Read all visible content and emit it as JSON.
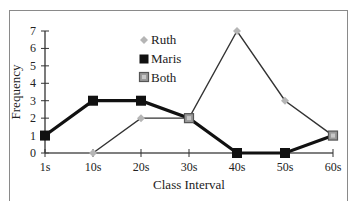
{
  "chart_data": {
    "type": "line",
    "title": "",
    "xlabel": "Class Interval",
    "ylabel": "Frequency",
    "categories": [
      "1s",
      "10s",
      "20s",
      "30s",
      "40s",
      "50s",
      "60s"
    ],
    "yticks": [
      "0",
      "1",
      "2",
      "3",
      "4",
      "5",
      "6",
      "7"
    ],
    "ylim": [
      0,
      7
    ],
    "grid": false,
    "legend_position": "upper-center-inside",
    "series": [
      {
        "name": "Ruth",
        "values": [
          null,
          0,
          2,
          2,
          7,
          3,
          1
        ],
        "color": "#b5b5b5",
        "line_color": "#333333",
        "marker": "diamond"
      },
      {
        "name": "Maris",
        "values": [
          1,
          3,
          3,
          2,
          0,
          0,
          1
        ],
        "color": "#111111",
        "line_color": "#111111",
        "marker": "square"
      }
    ],
    "legend": [
      {
        "label": "Ruth",
        "marker": "diamond",
        "color": "#b5b5b5"
      },
      {
        "label": "Maris",
        "marker": "square",
        "color": "#111111"
      },
      {
        "label": "Both",
        "marker": "square-outlined",
        "color": "#9a9a9a"
      }
    ],
    "annotations": [
      "'Both' marker shown where Ruth and Maris values coincide (30s, 60s)"
    ]
  }
}
